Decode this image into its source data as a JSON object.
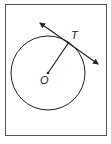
{
  "diagram": {
    "points": {
      "center": {
        "label": "O"
      },
      "tangent_point": {
        "label": "T"
      }
    },
    "elements": [
      {
        "type": "circle",
        "center": "O",
        "passes_through": "T"
      },
      {
        "type": "segment",
        "from": "O",
        "to": "T",
        "role": "radius"
      },
      {
        "type": "line",
        "through": "T",
        "role": "tangent",
        "arrows": "both-ends"
      }
    ],
    "colors": {
      "stroke": "#222222",
      "frame": "#555555",
      "background": "#ffffff"
    }
  }
}
